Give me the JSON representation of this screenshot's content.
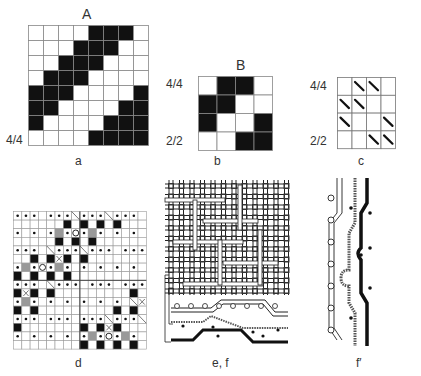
{
  "panel_a": {
    "title": "A",
    "caption": "a",
    "ratio_label": "4/4",
    "rows": [
      "WWWWBBBW",
      "WWWBBBWW",
      "WWBBBWWW",
      "WBBBWWWW",
      "BBBWWWWB",
      "BBWWWWBB",
      "BWWWWBBB",
      "WWWWBBBB"
    ]
  },
  "panel_b": {
    "title": "B",
    "caption": "b",
    "ratio_top": "4/4",
    "ratio_bottom": "2/2",
    "rows": [
      "WBBW",
      "BBWW",
      "BWWB",
      "WWBB"
    ]
  },
  "panel_c": {
    "caption": "c",
    "ratio_top": "4/4",
    "ratio_bottom": "2/2",
    "rows": [
      "-\\\\-",
      "\\\\--",
      "\\--\\",
      "--\\\\"
    ]
  },
  "panel_d": {
    "caption": "d",
    "legend": {
      ".": "dot",
      "B": "black",
      "G": "gray",
      "O": "circle",
      "X": "cross",
      "/": "diagonal",
      "-": "empty"
    },
    "rows": [
      "...-.../.../...-",
      "------B-B-B-B---",
      ".-.-.G.O.G.-.-.-",
      "-----B-B-B------",
      "...-/.../...-...",
      "--B-BXB-B-------",
      ".G.O.G.-.-.-.-.-",
      "B-B-B-B---------",
      "...-/...-...-.../",
      "BXB-B---------B-",
      ".G.-.-.-.-.-.-/X",
      "B-B---------B-B-",
      "...-...-.../.../",
      "B-------B-BXB---",
      ".-.-.-.-.G.O.G.-",
      "--------B-B-B-B-"
    ]
  },
  "panel_ef": {
    "caption": "e, f"
  },
  "panel_fprime": {
    "caption": "f′"
  }
}
